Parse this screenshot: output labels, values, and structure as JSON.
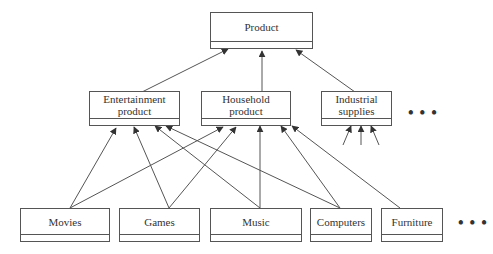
{
  "diagram": {
    "type": "class hierarchy (UML generalization)",
    "root": {
      "label": "Product"
    },
    "categories": [
      {
        "label": "Entertainment\nproduct"
      },
      {
        "label": "Household\nproduct"
      },
      {
        "label": "Industrial\nsupplies"
      }
    ],
    "items": [
      {
        "label": "Movies"
      },
      {
        "label": "Games"
      },
      {
        "label": "Music"
      },
      {
        "label": "Computers"
      },
      {
        "label": "Furniture"
      }
    ],
    "ellipsis": "• • •",
    "edges": [
      {
        "from": "Entertainment product",
        "to": "Product"
      },
      {
        "from": "Household product",
        "to": "Product"
      },
      {
        "from": "Industrial supplies",
        "to": "Product"
      },
      {
        "from": "Movies",
        "to": "Entertainment product"
      },
      {
        "from": "Movies",
        "to": "Household product"
      },
      {
        "from": "Games",
        "to": "Entertainment product"
      },
      {
        "from": "Games",
        "to": "Household product"
      },
      {
        "from": "Music",
        "to": "Entertainment product"
      },
      {
        "from": "Music",
        "to": "Household product"
      },
      {
        "from": "Computers",
        "to": "Entertainment product"
      },
      {
        "from": "Computers",
        "to": "Household product"
      },
      {
        "from": "Furniture",
        "to": "Household product"
      }
    ]
  }
}
